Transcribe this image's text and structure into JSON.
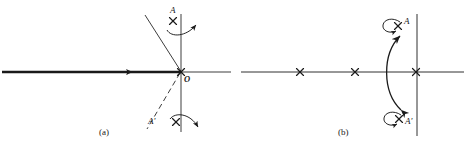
{
  "figure": {
    "background_color": "#ffffff",
    "ink_color": "#1a1a1a"
  },
  "panel_a": {
    "caption": "(a)",
    "labels": {
      "point_a": "A",
      "point_a_prime": "A'",
      "origin": "O"
    },
    "markers": [
      {
        "name": "pole-a",
        "label": "A",
        "x": 173,
        "y": 21
      },
      {
        "name": "pole-a-prime",
        "label": "A'",
        "x": 176,
        "y": 122
      },
      {
        "name": "origin-cross",
        "label": "O",
        "x": 181,
        "y": 72
      }
    ],
    "axes": {
      "real_axis_y": 72,
      "real_axis_x_start": 2,
      "real_axis_x_end": 231,
      "imag_axis_x": 181,
      "imag_axis_y_start": 14,
      "imag_axis_y_end": 132,
      "locus_arrow_x": 131,
      "locus_arrow_direction": "left"
    },
    "asymptotes": [
      {
        "name": "branch-upper",
        "style": "solid",
        "from_x": 181,
        "from_y": 72,
        "to_x": 145,
        "to_y": 15
      },
      {
        "name": "branch-lower",
        "style": "dashed",
        "from_x": 181,
        "from_y": 72,
        "to_x": 147,
        "to_y": 128
      }
    ]
  },
  "panel_b": {
    "caption": "(b)",
    "labels": {
      "point_a": "A",
      "point_a_prime": "A'"
    },
    "markers": [
      {
        "name": "pole-1",
        "label": "",
        "x": 300,
        "y": 72
      },
      {
        "name": "pole-2",
        "label": "",
        "x": 355,
        "y": 72
      },
      {
        "name": "pole-3",
        "label": "",
        "x": 416,
        "y": 72
      },
      {
        "name": "pole-a",
        "label": "A",
        "x": 398,
        "y": 26
      },
      {
        "name": "pole-a-prime",
        "label": "A'",
        "x": 399,
        "y": 119
      }
    ],
    "axes": {
      "real_axis_y": 72,
      "real_axis_x_start": 241,
      "real_axis_x_end": 464,
      "imag_axis_x": 417,
      "imag_axis_y_start": 14,
      "imag_axis_y_end": 136
    },
    "migration_arrow": {
      "name": "migration-double-arrow",
      "heads": "both",
      "from_x": 400,
      "from_y": 35,
      "to_x": 399,
      "to_y": 110,
      "bow": "left"
    }
  }
}
